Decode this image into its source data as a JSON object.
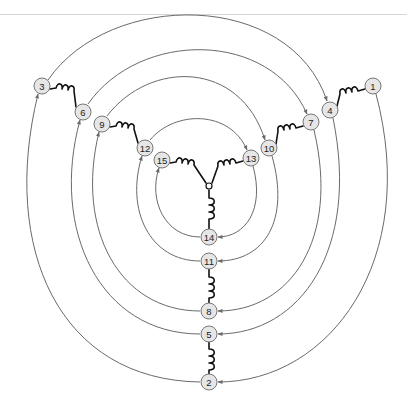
{
  "diagram": {
    "type": "three-phase star-connected winding diagram",
    "nodes": [
      {
        "id": "1",
        "label": "1",
        "x": 373,
        "y": 86
      },
      {
        "id": "2",
        "label": "2",
        "x": 209,
        "y": 382
      },
      {
        "id": "3",
        "label": "3",
        "x": 42,
        "y": 86
      },
      {
        "id": "4",
        "label": "4",
        "x": 330,
        "y": 110
      },
      {
        "id": "5",
        "label": "5",
        "x": 209,
        "y": 334
      },
      {
        "id": "6",
        "label": "6",
        "x": 83,
        "y": 112
      },
      {
        "id": "7",
        "label": "7",
        "x": 311,
        "y": 122
      },
      {
        "id": "8",
        "label": "8",
        "x": 209,
        "y": 311
      },
      {
        "id": "9",
        "label": "9",
        "x": 102,
        "y": 124
      },
      {
        "id": "10",
        "label": "10",
        "x": 269,
        "y": 148
      },
      {
        "id": "11",
        "label": "11",
        "x": 209,
        "y": 261
      },
      {
        "id": "12",
        "label": "12",
        "x": 145,
        "y": 148
      },
      {
        "id": "13",
        "label": "13",
        "x": 251,
        "y": 158
      },
      {
        "id": "14",
        "label": "14",
        "x": 209,
        "y": 237
      },
      {
        "id": "15",
        "label": "15",
        "x": 162,
        "y": 160
      }
    ],
    "coils": [
      {
        "from": "1",
        "to": "4"
      },
      {
        "from": "7",
        "to": "10"
      },
      {
        "from": "13",
        "to": "center"
      },
      {
        "from": "3",
        "to": "6"
      },
      {
        "from": "9",
        "to": "12"
      },
      {
        "from": "15",
        "to": "center"
      },
      {
        "from": "center",
        "to": "14"
      },
      {
        "from": "11",
        "to": "8"
      },
      {
        "from": "5",
        "to": "2"
      }
    ],
    "arcs": [
      {
        "from": "3",
        "to": "4",
        "side": "top"
      },
      {
        "from": "6",
        "to": "7",
        "side": "top"
      },
      {
        "from": "9",
        "to": "10",
        "side": "top"
      },
      {
        "from": "12",
        "to": "13",
        "side": "top"
      },
      {
        "from": "1",
        "to": "2",
        "side": "right"
      },
      {
        "from": "4",
        "to": "5",
        "side": "right"
      },
      {
        "from": "7",
        "to": "8",
        "side": "right"
      },
      {
        "from": "10",
        "to": "11",
        "side": "right"
      },
      {
        "from": "13",
        "to": "14",
        "side": "right"
      },
      {
        "from": "2",
        "to": "3",
        "side": "left"
      },
      {
        "from": "5",
        "to": "6",
        "side": "left"
      },
      {
        "from": "8",
        "to": "9",
        "side": "left"
      },
      {
        "from": "11",
        "to": "12",
        "side": "left"
      },
      {
        "from": "14",
        "to": "15",
        "side": "left"
      }
    ],
    "center_junction": {
      "x": 209,
      "y": 186
    },
    "colors": {
      "arc": "#6a6a6a",
      "coil": "#111111",
      "node_fill": "#e6e6e6",
      "node_stroke": "#777777"
    }
  }
}
